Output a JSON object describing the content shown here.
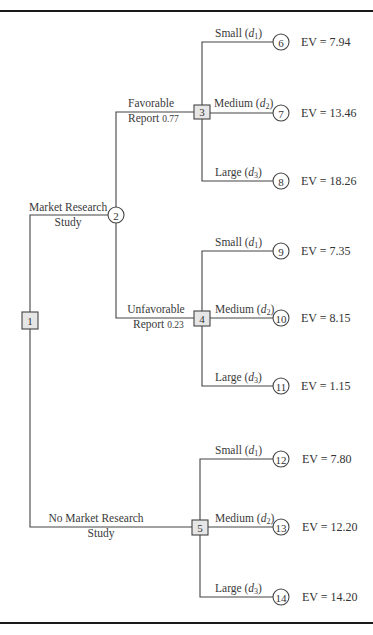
{
  "figure": {
    "type": "decision-tree",
    "nodes": [
      {
        "id": "1",
        "kind": "decision",
        "x": 30,
        "y": 320
      },
      {
        "id": "2",
        "kind": "chance",
        "x": 116,
        "y": 215
      },
      {
        "id": "3",
        "kind": "decision",
        "x": 202,
        "y": 112
      },
      {
        "id": "4",
        "kind": "decision",
        "x": 202,
        "y": 318
      },
      {
        "id": "5",
        "kind": "decision",
        "x": 200,
        "y": 527
      },
      {
        "id": "6",
        "kind": "chance",
        "x": 281,
        "y": 42
      },
      {
        "id": "7",
        "kind": "chance",
        "x": 281,
        "y": 113
      },
      {
        "id": "8",
        "kind": "chance",
        "x": 281,
        "y": 181
      },
      {
        "id": "9",
        "kind": "chance",
        "x": 281,
        "y": 251
      },
      {
        "id": "10",
        "kind": "chance",
        "x": 281,
        "y": 318
      },
      {
        "id": "11",
        "kind": "chance",
        "x": 281,
        "y": 386
      },
      {
        "id": "12",
        "kind": "chance",
        "x": 281,
        "y": 459
      },
      {
        "id": "13",
        "kind": "chance",
        "x": 281,
        "y": 527
      },
      {
        "id": "14",
        "kind": "chance",
        "x": 281,
        "y": 597
      }
    ],
    "branches": {
      "market_research": {
        "line1": "Market Research",
        "line2": "Study"
      },
      "no_market_research": {
        "line1": "No Market Research",
        "line2": "Study"
      },
      "favorable": {
        "line1": "Favorable",
        "line2": "Report",
        "prob": "0.77"
      },
      "unfavorable": {
        "line1": "Unfavorable",
        "line2": "Report",
        "prob": "0.23"
      }
    },
    "decision_labels": {
      "small": {
        "word": "Small",
        "var": "d",
        "sub": "1"
      },
      "medium": {
        "word": "Medium",
        "var": "d",
        "sub": "2"
      },
      "large": {
        "word": "Large",
        "var": "d",
        "sub": "3"
      }
    },
    "outcomes": [
      {
        "node": "6",
        "decision": "Small (d1)",
        "ev": "EV = 7.94"
      },
      {
        "node": "7",
        "decision": "Medium (d2)",
        "ev": "EV = 13.46"
      },
      {
        "node": "8",
        "decision": "Large (d3)",
        "ev": "EV = 18.26"
      },
      {
        "node": "9",
        "decision": "Small (d1)",
        "ev": "EV = 7.35"
      },
      {
        "node": "10",
        "decision": "Medium (d2)",
        "ev": "EV = 8.15"
      },
      {
        "node": "11",
        "decision": "Large (d3)",
        "ev": "EV = 1.15"
      },
      {
        "node": "12",
        "decision": "Small (d1)",
        "ev": "EV = 7.80"
      },
      {
        "node": "13",
        "decision": "Medium (d2)",
        "ev": "EV = 12.20"
      },
      {
        "node": "14",
        "decision": "Large (d3)",
        "ev": "EV = 14.20"
      }
    ],
    "colors": {
      "line": "#444444",
      "rule": "#1a1a1a",
      "decision_fill": "#e6e6e6",
      "text": "#3a3a3a"
    }
  }
}
